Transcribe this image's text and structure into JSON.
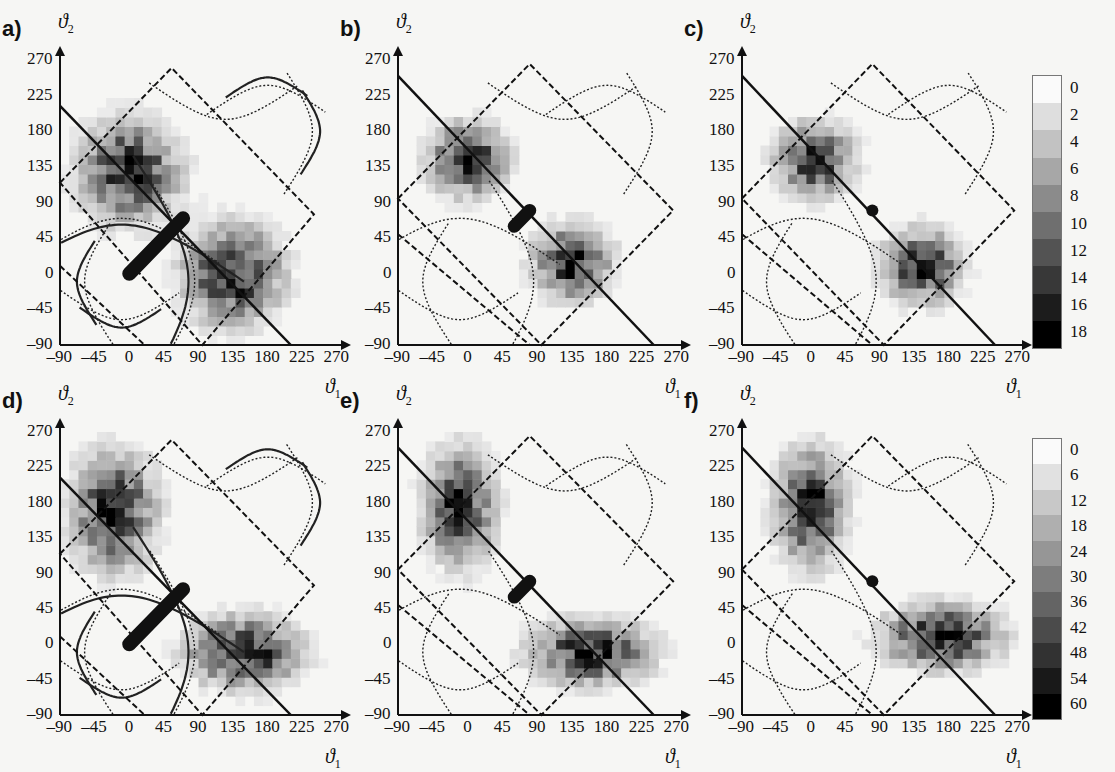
{
  "figure": {
    "panels": [
      {
        "id": "a",
        "label": "a)",
        "colorbar": "top"
      },
      {
        "id": "b",
        "label": "b)",
        "colorbar": "top"
      },
      {
        "id": "c",
        "label": "c)",
        "colorbar": "top"
      },
      {
        "id": "d",
        "label": "d)",
        "colorbar": "bottom"
      },
      {
        "id": "e",
        "label": "e)",
        "colorbar": "bottom"
      },
      {
        "id": "f",
        "label": "f)",
        "colorbar": "bottom"
      }
    ],
    "xaxis_symbol": "ϑ",
    "xaxis_sub": "1",
    "yaxis_symbol": "ϑ",
    "yaxis_sub": "2"
  },
  "chart_data": [
    {
      "type": "heatmap",
      "panel": "a",
      "title": "a)",
      "xlabel": "ϑ1",
      "ylabel": "ϑ2",
      "xlim": [
        -90,
        270
      ],
      "ylim": [
        -90,
        270
      ],
      "xticks": [
        -90,
        -45,
        0,
        45,
        90,
        135,
        180,
        225,
        270
      ],
      "yticks": [
        -90,
        -45,
        0,
        45,
        90,
        135,
        180,
        225,
        270
      ],
      "colorbar": {
        "ticks": [
          0,
          2,
          4,
          6,
          8,
          10,
          12,
          14,
          16,
          18
        ]
      },
      "clusters": [
        {
          "center": [
            0,
            130
          ],
          "spread": [
            70,
            70
          ],
          "peak": 16
        },
        {
          "center": [
            135,
            0
          ],
          "spread": [
            70,
            70
          ],
          "peak": 16
        }
      ],
      "annotations": [
        "thick bar from (0,0) to (70,70)",
        "solid diagonal line",
        "dashed rotated square",
        "solid and dotted contour curves"
      ]
    },
    {
      "type": "heatmap",
      "panel": "b",
      "title": "b)",
      "xlabel": "ϑ1",
      "ylabel": "ϑ2",
      "xlim": [
        -90,
        270
      ],
      "ylim": [
        -90,
        270
      ],
      "xticks": [
        -90,
        -45,
        0,
        45,
        90,
        135,
        180,
        225,
        270
      ],
      "yticks": [
        -90,
        -45,
        0,
        45,
        90,
        135,
        180,
        225,
        270
      ],
      "colorbar": {
        "ticks": [
          0,
          2,
          4,
          6,
          8,
          10,
          12,
          14,
          16,
          18
        ]
      },
      "clusters": [
        {
          "center": [
            0,
            145
          ],
          "spread": [
            55,
            50
          ],
          "peak": 14
        },
        {
          "center": [
            135,
            15
          ],
          "spread": [
            55,
            50
          ],
          "peak": 14
        }
      ],
      "annotations": [
        "short thick bar near (70,70)",
        "solid diagonal line",
        "dashed rotated square",
        "dotted contour curves"
      ]
    },
    {
      "type": "heatmap",
      "panel": "c",
      "title": "c)",
      "xlabel": "ϑ1",
      "ylabel": "ϑ2",
      "xlim": [
        -90,
        270
      ],
      "ylim": [
        -90,
        270
      ],
      "xticks": [
        -90,
        -45,
        0,
        45,
        90,
        135,
        180,
        225,
        270
      ],
      "yticks": [
        -90,
        -45,
        0,
        45,
        90,
        135,
        180,
        225,
        270
      ],
      "colorbar": {
        "ticks": [
          0,
          2,
          4,
          6,
          8,
          10,
          12,
          14,
          16,
          18
        ]
      },
      "clusters": [
        {
          "center": [
            5,
            145
          ],
          "spread": [
            55,
            50
          ],
          "peak": 11
        },
        {
          "center": [
            145,
            10
          ],
          "spread": [
            55,
            50
          ],
          "peak": 11
        }
      ],
      "annotations": [
        "dot at (80,80)",
        "solid diagonal line",
        "dashed rotated square",
        "dotted contour curves"
      ]
    },
    {
      "type": "heatmap",
      "panel": "d",
      "title": "d)",
      "xlabel": "ϑ1",
      "ylabel": "ϑ2",
      "xlim": [
        -90,
        270
      ],
      "ylim": [
        -90,
        270
      ],
      "xticks": [
        -90,
        -45,
        0,
        45,
        90,
        135,
        180,
        225,
        270
      ],
      "yticks": [
        -90,
        -45,
        0,
        45,
        90,
        135,
        180,
        225,
        270
      ],
      "colorbar": {
        "ticks": [
          0,
          6,
          12,
          18,
          24,
          30,
          36,
          42,
          48,
          54,
          60
        ]
      },
      "clusters": [
        {
          "center": [
            -20,
            170
          ],
          "spread": [
            60,
            80
          ],
          "peak": 50
        },
        {
          "center": [
            150,
            -10
          ],
          "spread": [
            80,
            50
          ],
          "peak": 50
        }
      ],
      "annotations": [
        "thick bar from (0,0) to (70,70)",
        "solid diagonal line",
        "dashed rotated square",
        "solid and dotted contour curves"
      ]
    },
    {
      "type": "heatmap",
      "panel": "e",
      "title": "e)",
      "xlabel": "ϑ1",
      "ylabel": "ϑ2",
      "xlim": [
        -90,
        270
      ],
      "ylim": [
        -90,
        270
      ],
      "xticks": [
        -90,
        -45,
        0,
        45,
        90,
        135,
        180,
        225,
        270
      ],
      "yticks": [
        -90,
        -45,
        0,
        45,
        90,
        135,
        180,
        225,
        270
      ],
      "colorbar": {
        "ticks": [
          0,
          6,
          12,
          18,
          24,
          30,
          36,
          42,
          48,
          54,
          60
        ]
      },
      "clusters": [
        {
          "center": [
            -10,
            175
          ],
          "spread": [
            50,
            80
          ],
          "peak": 55
        },
        {
          "center": [
            160,
            -10
          ],
          "spread": [
            85,
            45
          ],
          "peak": 55
        }
      ],
      "annotations": [
        "short thick bar near (70,70)",
        "solid diagonal line",
        "dashed rotated square",
        "dotted contour curves"
      ]
    },
    {
      "type": "heatmap",
      "panel": "f",
      "title": "f)",
      "xlabel": "ϑ1",
      "ylabel": "ϑ2",
      "xlim": [
        -90,
        270
      ],
      "ylim": [
        -90,
        270
      ],
      "xticks": [
        -90,
        -45,
        0,
        45,
        90,
        135,
        180,
        225,
        270
      ],
      "yticks": [
        -90,
        -45,
        0,
        45,
        90,
        135,
        180,
        225,
        270
      ],
      "colorbar": {
        "ticks": [
          0,
          6,
          12,
          18,
          24,
          30,
          36,
          42,
          48,
          54,
          60
        ]
      },
      "clusters": [
        {
          "center": [
            0,
            175
          ],
          "spread": [
            50,
            80
          ],
          "peak": 48
        },
        {
          "center": [
            170,
            10
          ],
          "spread": [
            85,
            45
          ],
          "peak": 48
        }
      ],
      "annotations": [
        "dot at (80,80)",
        "solid diagonal line",
        "dashed rotated square",
        "dotted contour curves"
      ]
    }
  ],
  "colorbars": {
    "top": {
      "ticks": [
        "0",
        "2",
        "4",
        "6",
        "8",
        "10",
        "12",
        "14",
        "16",
        "18"
      ]
    },
    "bottom": {
      "ticks": [
        "0",
        "6",
        "12",
        "18",
        "24",
        "30",
        "36",
        "42",
        "48",
        "54",
        "60"
      ]
    }
  },
  "tick_labels": [
    "-90",
    "-45",
    "0",
    "45",
    "90",
    "135",
    "180",
    "225",
    "270"
  ]
}
